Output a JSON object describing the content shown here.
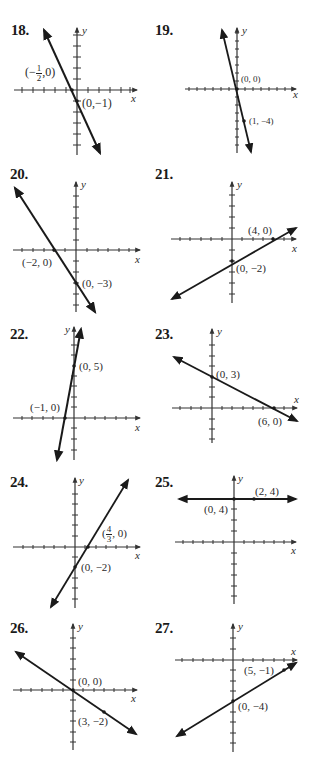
{
  "problems": [
    {
      "number": "18.",
      "x_label": "x",
      "y_label": "y",
      "points": [
        {
          "label": "(−1/2, 0)",
          "num": "1",
          "den": "2",
          "prefix": "(−",
          "suffix": ",0)"
        },
        {
          "label": "(0,−1)"
        }
      ]
    },
    {
      "number": "19.",
      "x_label": "x",
      "y_label": "y",
      "points": [
        {
          "label": "(0, 0)"
        },
        {
          "label": "(1, −4)"
        }
      ]
    },
    {
      "number": "20.",
      "x_label": "x",
      "y_label": "y",
      "points": [
        {
          "label": "(−2, 0)"
        },
        {
          "label": "(0, −3)"
        }
      ]
    },
    {
      "number": "21.",
      "x_label": "x",
      "y_label": "y",
      "points": [
        {
          "label": "(4, 0)"
        },
        {
          "label": "(0, −2)"
        }
      ]
    },
    {
      "number": "22.",
      "x_label": "x",
      "y_label": "y",
      "points": [
        {
          "label": "(0, 5)"
        },
        {
          "label": "(−1, 0)"
        }
      ]
    },
    {
      "number": "23.",
      "x_label": "x",
      "y_label": "y",
      "points": [
        {
          "label": "(0, 3)"
        },
        {
          "label": "(6, 0)"
        }
      ]
    },
    {
      "number": "24.",
      "x_label": "x",
      "y_label": "y",
      "points": [
        {
          "label": "(4/3, 0)",
          "num": "4",
          "den": "3",
          "prefix": "(",
          "suffix": ", 0)"
        },
        {
          "label": "(0, −2)"
        }
      ]
    },
    {
      "number": "25.",
      "x_label": "x",
      "y_label": "y",
      "points": [
        {
          "label": "(2, 4)"
        },
        {
          "label": "(0, 4)"
        }
      ]
    },
    {
      "number": "26.",
      "x_label": "x",
      "y_label": "y",
      "points": [
        {
          "label": "(0, 0)"
        },
        {
          "label": "(3, −2)"
        }
      ]
    },
    {
      "number": "27.",
      "x_label": "x",
      "y_label": "y",
      "points": [
        {
          "label": "(5, −1)"
        },
        {
          "label": "(0, −4)"
        }
      ]
    }
  ],
  "colors": {
    "ink": "#1a1a1a",
    "axis": "#333333",
    "background": "#ffffff"
  }
}
